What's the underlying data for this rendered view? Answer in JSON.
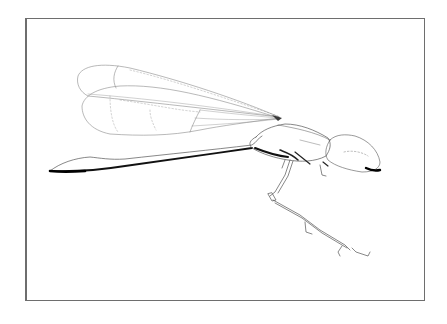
{
  "figure": {
    "subject": "Damselfly line drawing, lateral view",
    "style": "scientific pen illustration",
    "parts": [
      "forewing",
      "hindwing",
      "abdomen",
      "thorax",
      "head",
      "compound-eye",
      "legs"
    ],
    "colors": {
      "background": "#ffffff",
      "frame": "#6e6e6e",
      "ink": "#2a2a2a",
      "fine_line": "#8a8a8a"
    }
  }
}
